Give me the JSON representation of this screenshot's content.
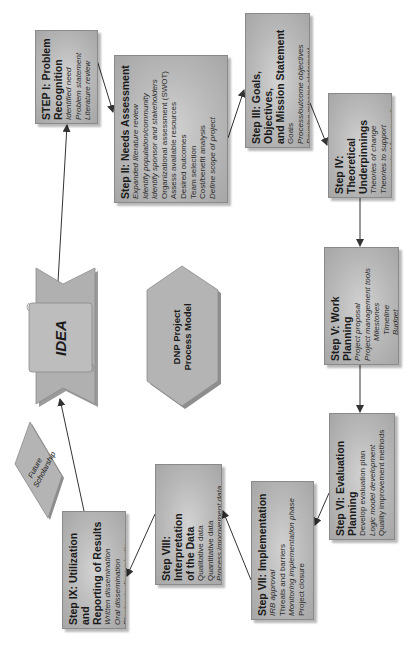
{
  "diagram": {
    "center_label": "DNP Project Process Model",
    "center_label_lines": [
      "DNP Project",
      "Process Model"
    ],
    "idea_label": "IDEA",
    "future_label_lines": [
      "Future",
      "Scholarship"
    ],
    "colors": {
      "box_fill": "#b8b8b8",
      "box_border": "#8a8a8a",
      "arrow": "#333333",
      "background": "#ffffff"
    },
    "steps": [
      {
        "id": "I",
        "title_lines": [
          "STEP I: Problem",
          "Recognition"
        ],
        "items": [
          "Identified need",
          "Problem statement",
          "Literature review"
        ]
      },
      {
        "id": "II",
        "title_lines": [
          "Step II: Needs Assessment"
        ],
        "items": [
          "Expanded literature review",
          "Identify population/community",
          "Identify sponsor and stakeholders",
          "Organizational assessment (SWOT)",
          "Assess available resources",
          "Desired outcomes",
          "Team selection",
          "Cost/benefit analysis",
          "Define scope of project"
        ]
      },
      {
        "id": "III",
        "title_lines": [
          "Step III: Goals, Objectives,",
          "and Mission Statement"
        ],
        "items": [
          "Goals",
          "Process/outcome objectives",
          "Develop mission statement"
        ]
      },
      {
        "id": "IV",
        "title_lines": [
          "Step IV: Theoretical",
          "Underpinnings"
        ],
        "items": [
          "Theories of change",
          "Theories to support",
          "project framework"
        ]
      },
      {
        "id": "V",
        "title_lines": [
          "Step V: Work Planning"
        ],
        "items": [
          "Project proposal",
          "Project management tools",
          "Milestones",
          "Timeline",
          "Budget"
        ]
      },
      {
        "id": "VI",
        "title_lines": [
          "Step VI: Evaluation",
          "Planning"
        ],
        "items": [
          "Develop evaluation plan",
          "Logic model development",
          "Quality improvement methods"
        ]
      },
      {
        "id": "VII",
        "title_lines": [
          "Step VII: Implementation"
        ],
        "items": [
          "IRB approval",
          "Threats and barriers",
          "Monitoring implementation phase",
          "Project closure"
        ]
      },
      {
        "id": "VIII",
        "title_lines": [
          "Step VIII: Interpretation",
          "of the Data"
        ],
        "items": [
          "Qualitative data",
          "Quantitative data",
          "Process improvement data"
        ]
      },
      {
        "id": "IX",
        "title_lines": [
          "Step IX: Utilization and",
          "Reporting of Results"
        ],
        "items": [
          "Written dissemination",
          "Oral dissemination",
          "Electronic dissemination"
        ]
      }
    ]
  }
}
